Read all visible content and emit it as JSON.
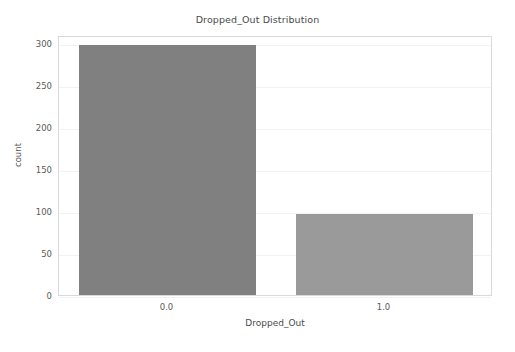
{
  "chart_data": {
    "type": "bar",
    "title": "Dropped_Out Distribution",
    "xlabel": "Dropped_Out",
    "ylabel": "count",
    "categories": [
      "0.0",
      "1.0"
    ],
    "values": [
      298,
      96
    ],
    "ylim": [
      0,
      310
    ],
    "yticks": [
      0,
      50,
      100,
      150,
      200,
      250,
      300
    ],
    "ytick_labels": [
      "0",
      "50",
      "100",
      "150",
      "200",
      "250",
      "300"
    ],
    "grid": "horizontal",
    "legend": "none",
    "bar_colors": [
      "#808080",
      "#9a9a9a"
    ],
    "background_color": "#ffffff",
    "axes_edge_color": "#d9d9d9",
    "gridline_color": "#f2f2f2",
    "bars": [
      {
        "category": "0.0",
        "value": 298,
        "color": "#808080"
      },
      {
        "category": "1.0",
        "value": 96,
        "color": "#9a9a9a"
      }
    ]
  }
}
